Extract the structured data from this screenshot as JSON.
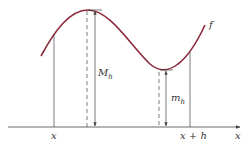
{
  "diagram": {
    "colors": {
      "curve": "#8a2a3a",
      "lines": "#444444",
      "text": "#333333"
    },
    "curve_label": "f",
    "axis_label": "x",
    "ticks": {
      "left": "x",
      "right": "x + h"
    },
    "max_label": {
      "main": "M",
      "sub": "h"
    },
    "min_label": {
      "main": "m",
      "sub": "h"
    }
  }
}
